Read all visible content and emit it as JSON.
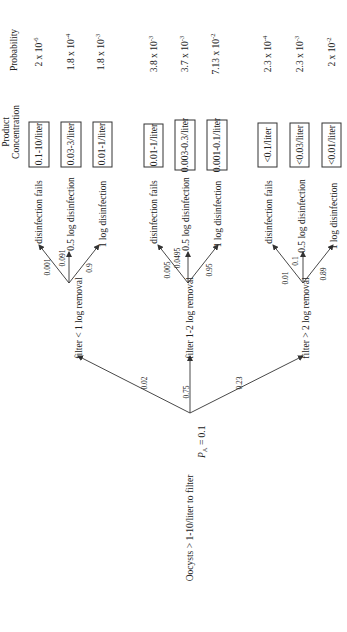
{
  "diagram": {
    "type": "probability-tree",
    "orientation": "rotated-90-ccw",
    "root": {
      "label": "Oocysts > 1-10/liter to filter",
      "sublabel": "P",
      "sublabel_sub": "A",
      "sublabel_value": " = 0.1"
    },
    "headers": {
      "product_line1": "Product",
      "product_line2": "Concentration",
      "probability": "Probability"
    },
    "filters": [
      {
        "label": "filter < 1 log removal",
        "prob": "0.02",
        "branches": [
          {
            "prob": "0.001",
            "label": "disinfection fails",
            "concentration": "0.1-10/liter",
            "p_mant": "2 x 10",
            "p_exp": "-6"
          },
          {
            "prob": "0.091",
            "label": "0.5 log disinfection",
            "concentration": "0.03-3/liter",
            "p_mant": "1.8 x 10",
            "p_exp": "-4"
          },
          {
            "prob": "0.9",
            "label": "1 log disinfection",
            "concentration": "0.01-1/liter",
            "p_mant": "1.8 x 10",
            "p_exp": "-3"
          }
        ]
      },
      {
        "label": "filter 1-2 log removal",
        "prob": "0.75",
        "branches": [
          {
            "prob": "0.005",
            "label": "disinfection fails",
            "concentration": "0.01-1/liter",
            "p_mant": "3.8 x 10",
            "p_exp": "-3"
          },
          {
            "prob": "0.0495",
            "label": "0.5 log disinfection",
            "concentration": "0.003-0.3/liter",
            "p_mant": "3.7 x 10",
            "p_exp": "-3"
          },
          {
            "prob": "0.95",
            "label": "1 log disinfection",
            "concentration": "0.001-0.1/liter",
            "p_mant": "7.13 x 10",
            "p_exp": "-2"
          }
        ]
      },
      {
        "label": "filter > 2 log removal",
        "prob": "0.23",
        "branches": [
          {
            "prob": "0.01",
            "label": "disinfection fails",
            "concentration": "<0.1/liter",
            "p_mant": "2.3 x 10",
            "p_exp": "-4"
          },
          {
            "prob": "0.1",
            "label": "0.5 log disinfection",
            "concentration": "<0.03/liter",
            "p_mant": "2.3 x 10",
            "p_exp": "-3"
          },
          {
            "prob": "0.89",
            "label": "1 log disinfection",
            "concentration": "<0.01/liter",
            "p_mant": "2 x 10",
            "p_exp": "-2"
          }
        ]
      }
    ]
  }
}
